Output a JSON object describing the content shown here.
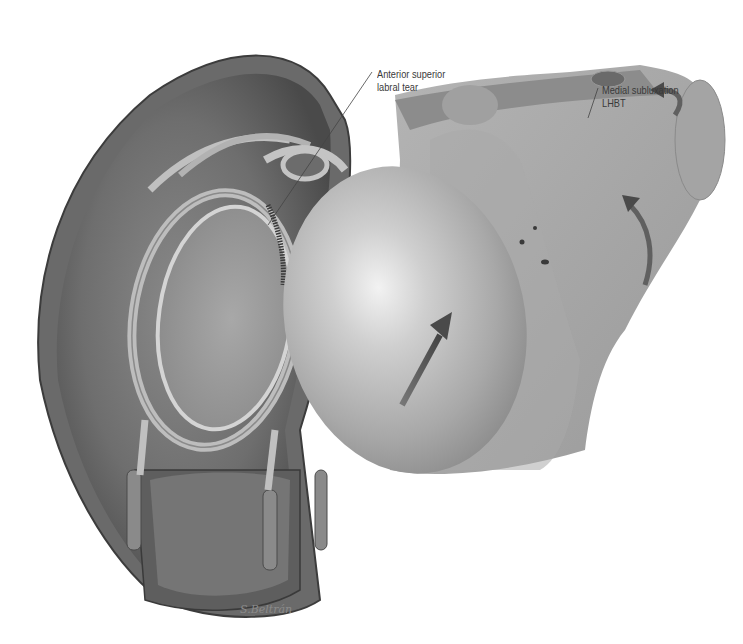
{
  "figure": {
    "labels": {
      "labral_tear": {
        "line1": "Anterior superior",
        "line2": "labral tear"
      },
      "subluxation": {
        "line1": "Medial subluxation",
        "line2": "LHBT"
      }
    },
    "signature": "S.Beltrán",
    "colors": {
      "background": "#ffffff",
      "tissue_dark": "#5a5a5a",
      "tissue_mid": "#8c8c8c",
      "bone_light": "#b8b8b8",
      "highlight": "#e8e8e8",
      "label_text": "#3a3a3a"
    }
  }
}
